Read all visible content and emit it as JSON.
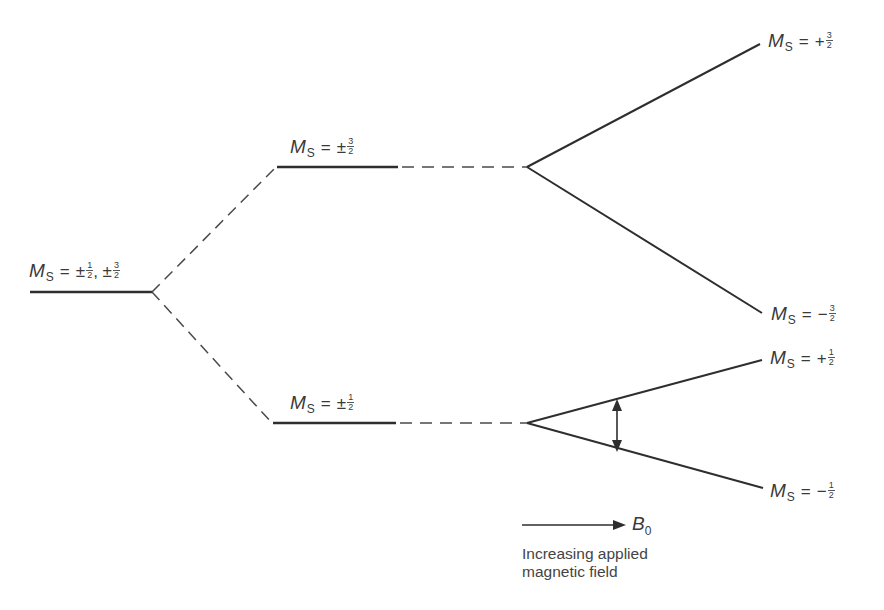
{
  "levels": {
    "zero_field": {
      "symbol": "M",
      "subscript": "S",
      "sign1": "±",
      "num1": "1",
      "den1": "2",
      "sep": ", ",
      "sign2": "±",
      "num2": "3",
      "den2": "2"
    },
    "zfs_upper": {
      "symbol": "M",
      "subscript": "S",
      "sign": "±",
      "num": "3",
      "den": "2"
    },
    "zfs_lower": {
      "symbol": "M",
      "subscript": "S",
      "sign": "±",
      "num": "1",
      "den": "2"
    },
    "zeeman_plus_3_2": {
      "symbol": "M",
      "subscript": "S",
      "sign": "+",
      "num": "3",
      "den": "2"
    },
    "zeeman_minus_3_2": {
      "symbol": "M",
      "subscript": "S",
      "sign": "−",
      "num": "3",
      "den": "2"
    },
    "zeeman_plus_1_2": {
      "symbol": "M",
      "subscript": "S",
      "sign": "+",
      "num": "1",
      "den": "2"
    },
    "zeeman_minus_1_2": {
      "symbol": "M",
      "subscript": "S",
      "sign": "−",
      "num": "1",
      "den": "2"
    }
  },
  "field_arrow": {
    "symbol": "B",
    "subscript": "0"
  },
  "caption": {
    "line1": "Increasing applied",
    "line2": "magnetic field"
  },
  "equals": "=",
  "colors": {
    "line": "#2e2e2e",
    "dashed": "#4a4a4a",
    "text": "#3a3a3a"
  }
}
